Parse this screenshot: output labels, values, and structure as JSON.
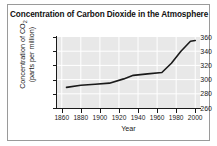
{
  "chart_data": {
    "type": "line",
    "title": "Concentration of Carbon Dioxide in the Atmosphere",
    "xlabel": "Year",
    "ylabel_line1": "Concentration of CO",
    "ylabel_sub": "2",
    "ylabel_line2": "(parts per million)",
    "xlim": [
      1855,
      2005
    ],
    "ylim": [
      260,
      360
    ],
    "xticks": [
      1860,
      1880,
      1900,
      1920,
      1940,
      1960,
      1980,
      2000
    ],
    "xtick_labels": [
      "1860",
      "1880",
      "1900",
      "1920",
      "1940",
      "1960",
      "1980",
      "2000"
    ],
    "yticks": [
      260,
      280,
      300,
      320,
      340,
      360
    ],
    "ytick_labels": [
      "260",
      "280",
      "300",
      "320",
      "340",
      "360"
    ],
    "grid": true,
    "grid_color": "#ffffff",
    "plot_background": "#e8e8e8",
    "line_color": "#1a1a1a",
    "legend": null,
    "x": [
      1865,
      1880,
      1895,
      1910,
      1925,
      1935,
      1950,
      1965,
      1975,
      1985,
      1995,
      2000
    ],
    "values": [
      289,
      292,
      293.5,
      295,
      301,
      306,
      308,
      310,
      323,
      340,
      354,
      355
    ],
    "series": [
      {
        "name": "CO2 concentration",
        "x": [
          1865,
          1880,
          1895,
          1910,
          1925,
          1935,
          1950,
          1965,
          1975,
          1985,
          1995,
          2000
        ],
        "values": [
          289,
          292,
          293.5,
          295,
          301,
          306,
          308,
          310,
          323,
          340,
          354,
          355
        ]
      }
    ]
  }
}
